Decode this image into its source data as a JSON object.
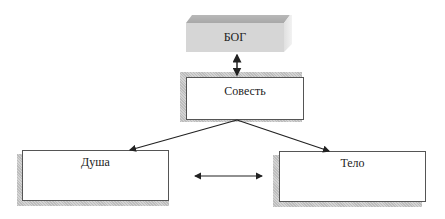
{
  "diagram": {
    "nodes": {
      "god": {
        "label": "БОГ"
      },
      "conscience": {
        "label": "Совесть"
      },
      "soul": {
        "label": "Душа"
      },
      "body": {
        "label": "Тело"
      }
    },
    "edges": [
      {
        "from": "god",
        "to": "conscience",
        "type": "bidirectional"
      },
      {
        "from": "conscience",
        "to": "soul",
        "type": "directed"
      },
      {
        "from": "conscience",
        "to": "body",
        "type": "directed"
      },
      {
        "from": "soul",
        "to": "body",
        "type": "bidirectional"
      }
    ],
    "colors": {
      "god_fill": "#d6d6d6",
      "box_border": "#555555",
      "shadow": "#c8c8c8",
      "arrow": "#222222"
    }
  }
}
